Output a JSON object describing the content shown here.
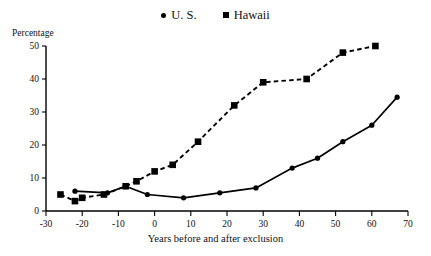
{
  "chart_data": {
    "type": "line",
    "title": "",
    "xlabel": "Years before and after exclusion",
    "ylabel": "Percentage",
    "xlim": [
      -30,
      70
    ],
    "ylim": [
      0,
      50
    ],
    "xticks": [
      -30,
      -20,
      -10,
      0,
      10,
      20,
      30,
      40,
      50,
      60,
      70
    ],
    "yticks": [
      0,
      10,
      20,
      30,
      40,
      50
    ],
    "grid": false,
    "legend_position": "top-center",
    "series": [
      {
        "name": "U. S.",
        "marker": "circle",
        "linestyle": "solid",
        "color": "#000000",
        "points": [
          {
            "x": -22,
            "y": 6
          },
          {
            "x": -13,
            "y": 5.5
          },
          {
            "x": -8,
            "y": 7.5
          },
          {
            "x": -2,
            "y": 5
          },
          {
            "x": 8,
            "y": 4
          },
          {
            "x": 18,
            "y": 5.5
          },
          {
            "x": 28,
            "y": 7
          },
          {
            "x": 38,
            "y": 13
          },
          {
            "x": 45,
            "y": 16
          },
          {
            "x": 52,
            "y": 21
          },
          {
            "x": 60,
            "y": 26
          },
          {
            "x": 67,
            "y": 34.5
          }
        ]
      },
      {
        "name": "Hawaii",
        "marker": "square",
        "linestyle": "dashed",
        "color": "#000000",
        "points": [
          {
            "x": -26,
            "y": 5
          },
          {
            "x": -22,
            "y": 3
          },
          {
            "x": -20,
            "y": 4
          },
          {
            "x": -14,
            "y": 5
          },
          {
            "x": -8,
            "y": 7.5
          },
          {
            "x": -5,
            "y": 9
          },
          {
            "x": 0,
            "y": 12
          },
          {
            "x": 5,
            "y": 14
          },
          {
            "x": 12,
            "y": 21
          },
          {
            "x": 22,
            "y": 32
          },
          {
            "x": 30,
            "y": 39
          },
          {
            "x": 42,
            "y": 40
          },
          {
            "x": 52,
            "y": 48
          },
          {
            "x": 61,
            "y": 50
          }
        ]
      }
    ]
  },
  "legend": {
    "entries": [
      {
        "label": "U. S.",
        "marker": "circle"
      },
      {
        "label": "Hawaii",
        "marker": "square"
      }
    ]
  },
  "axes": {
    "y_title": "Percentage",
    "x_title": "Years before and after exclusion",
    "x_tick_labels": [
      "-30",
      "-20",
      "-10",
      "0",
      "10",
      "20",
      "30",
      "40",
      "50",
      "60",
      "70"
    ],
    "y_tick_labels": [
      "0",
      "10",
      "20",
      "30",
      "40",
      "50"
    ]
  }
}
